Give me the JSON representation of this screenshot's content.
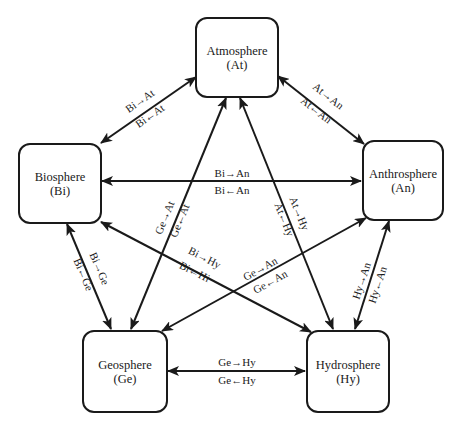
{
  "diagram": {
    "nodes": [
      {
        "id": "at",
        "name": "Atmosphere",
        "abbr": "(At)"
      },
      {
        "id": "bi",
        "name": "Biosphere",
        "abbr": "(Bi)"
      },
      {
        "id": "an",
        "name": "Anthrosphere",
        "abbr": "(An)"
      },
      {
        "id": "ge",
        "name": "Geosphere",
        "abbr": "(Ge)"
      },
      {
        "id": "hy",
        "name": "Hydrosphere",
        "abbr": "(Hy)"
      }
    ],
    "edges": [
      {
        "from": "bi",
        "to": "at",
        "forward": "Bi→At",
        "backward": "Bi←At"
      },
      {
        "from": "at",
        "to": "an",
        "forward": "At→An",
        "backward": "At←An"
      },
      {
        "from": "bi",
        "to": "an",
        "forward": "Bi→An",
        "backward": "Bi←An"
      },
      {
        "from": "ge",
        "to": "at",
        "forward": "Ge→At",
        "backward": "Ge←At"
      },
      {
        "from": "at",
        "to": "hy",
        "forward": "At→Hy",
        "backward": "At←Hy"
      },
      {
        "from": "bi",
        "to": "hy",
        "forward": "Bi→Hy",
        "backward": "Bi←Hi"
      },
      {
        "from": "ge",
        "to": "an",
        "forward": "Ge→An",
        "backward": "Ge←An"
      },
      {
        "from": "bi",
        "to": "ge",
        "forward": "Bi→Ge",
        "backward": "Bi←Ge"
      },
      {
        "from": "hy",
        "to": "an",
        "forward": "Hy→An",
        "backward": "Hy←An"
      },
      {
        "from": "ge",
        "to": "hy",
        "forward": "Ge→Hy",
        "backward": "Ge←Hy"
      }
    ]
  }
}
